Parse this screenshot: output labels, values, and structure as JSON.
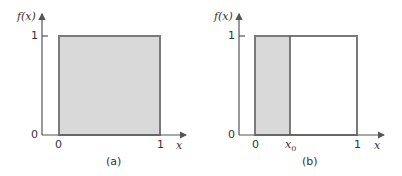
{
  "panels": [
    {
      "caption": "(a)",
      "y_label": "f(x)",
      "x_label": "x",
      "y_ticks": [
        "0",
        "1"
      ],
      "x_ticks": [
        "0",
        "1"
      ],
      "shaded_from": "0",
      "shaded_to": "1"
    },
    {
      "caption": "(b)",
      "y_label": "f(x)",
      "x_label": "x",
      "y_ticks": [
        "0",
        "1"
      ],
      "x_ticks": [
        "0",
        "x0",
        "1"
      ],
      "x0_base": "x",
      "x0_sub": "0",
      "shaded_from": "0",
      "shaded_to": "x0"
    }
  ],
  "colors": {
    "fill": "#d9d9d9",
    "stroke": "#7a7a7a",
    "axis": "#555555"
  }
}
